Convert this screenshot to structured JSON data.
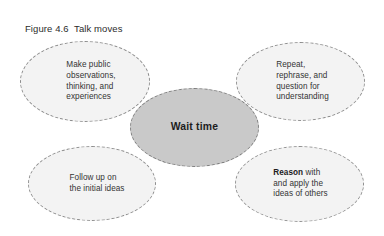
{
  "figure": {
    "label": "Figure 4.6",
    "title": "Talk moves",
    "caption_full": "Figure 4.6  Talk moves"
  },
  "colors": {
    "background": "#ffffff",
    "outer_node_fill": "#f3f3f3",
    "center_node_fill": "#c9c9c9",
    "node_border": "#8d8d8d",
    "center_node_border": "#7d7d7d",
    "body_text": "#333333",
    "heading_text": "#1d1d1d"
  },
  "diagram": {
    "type": "hub-and-spoke",
    "center": {
      "id": "wait-time",
      "label": "Wait time",
      "bold": true
    },
    "nodes": [
      {
        "id": "make-public",
        "position": "top-left",
        "text": "Make public\nobservations,\nthinking, and\nexperiences",
        "bold_lead": ""
      },
      {
        "id": "repeat-rephrase",
        "position": "top-right",
        "text": "Repeat,\nrephrase, and\nquestion for\nunderstanding",
        "bold_lead": ""
      },
      {
        "id": "follow-up",
        "position": "bottom-left",
        "text": "Follow up on\nthe initial ideas",
        "bold_lead": ""
      },
      {
        "id": "reason-with",
        "position": "bottom-right",
        "text": " with\nand apply the\nideas of others",
        "bold_lead": "Reason"
      }
    ]
  }
}
